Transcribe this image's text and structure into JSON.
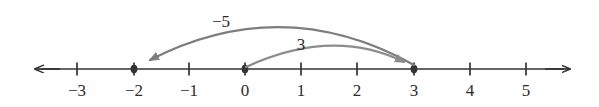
{
  "chart_data": {
    "type": "numberline",
    "title": "",
    "xlabel": "",
    "ylabel": "",
    "background_color": "#ffffff",
    "axis_color": "#333333",
    "axis": {
      "y_pixel": 69,
      "left_arrow_x": 34,
      "right_arrow_x": 571,
      "min_value": -3.75,
      "max_value": 5.8,
      "tick_step": 1
    },
    "ticks": [
      {
        "value": -3,
        "label": "−3",
        "x": 77,
        "marked": false
      },
      {
        "value": -2,
        "label": "−2",
        "x": 134,
        "marked": true
      },
      {
        "value": -1,
        "label": "−1",
        "x": 189,
        "marked": false
      },
      {
        "value": 0,
        "label": "0",
        "x": 245,
        "marked": true
      },
      {
        "value": 1,
        "label": "1",
        "x": 301,
        "marked": false
      },
      {
        "value": 2,
        "label": "2",
        "x": 357,
        "marked": false
      },
      {
        "value": 3,
        "label": "3",
        "x": 414,
        "marked": true
      },
      {
        "value": 4,
        "label": "4",
        "x": 470,
        "marked": false
      },
      {
        "value": 5,
        "label": "5",
        "x": 526,
        "marked": false
      }
    ],
    "tick_label_y": 82,
    "point_markers": [
      {
        "value": -2,
        "x": 134
      },
      {
        "value": 0,
        "x": 245
      },
      {
        "value": 3,
        "x": 414
      }
    ],
    "arcs": [
      {
        "name": "minus-five-arc",
        "label": "−5",
        "from_value": 3,
        "to_value": -2,
        "delta": -5,
        "direction": "left",
        "color": "#7d7d7d",
        "from_x": 414,
        "to_x": 139,
        "apex_x": 283,
        "apex_y": 29,
        "label_x": 221,
        "label_y": 13
      },
      {
        "name": "plus-three-arc",
        "label": "3",
        "from_value": 0,
        "to_value": 3,
        "delta": 3,
        "direction": "right",
        "color": "#8c8c8c",
        "from_x": 247,
        "to_x": 411,
        "apex_x": 333,
        "apex_y": 48,
        "label_x": 301,
        "label_y": 36
      }
    ],
    "annotations": [
      "Arc labeled −5 runs from 3 leftward to −2 with an arrowhead at −2.",
      "Arc labeled 3 runs from 0 rightward to 3 with an arrowhead at 3."
    ]
  }
}
